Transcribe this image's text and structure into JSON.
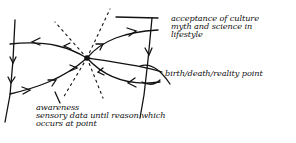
{
  "diagram": {
    "style": "hand-drawn sketch, black ink on white",
    "colors": {
      "ink": "#111111",
      "background": "#ffffff"
    },
    "center_point": {
      "name": "convergence-point",
      "x": 87,
      "y": 58
    },
    "labels": {
      "acceptance": "acceptance of culture\nmyth and science in\nlifestyle",
      "birth_death": "birth/death/reality point",
      "awareness": "awareness\nsensory data until reason which\noccurs at point"
    },
    "elements": [
      {
        "name": "left-vertical-line",
        "arrows": "downward"
      },
      {
        "name": "right-vertical-line",
        "arrows": "downward"
      },
      {
        "name": "upper-left-curve",
        "arrows": "outward-left"
      },
      {
        "name": "lower-left-curve",
        "arrows": "inward-to-center"
      },
      {
        "name": "upper-right-curve",
        "arrows": "outward-right"
      },
      {
        "name": "lower-right-curve",
        "arrows": "inward-to-center"
      },
      {
        "name": "dashed-rays",
        "style": "dotted",
        "count": 4
      }
    ]
  }
}
